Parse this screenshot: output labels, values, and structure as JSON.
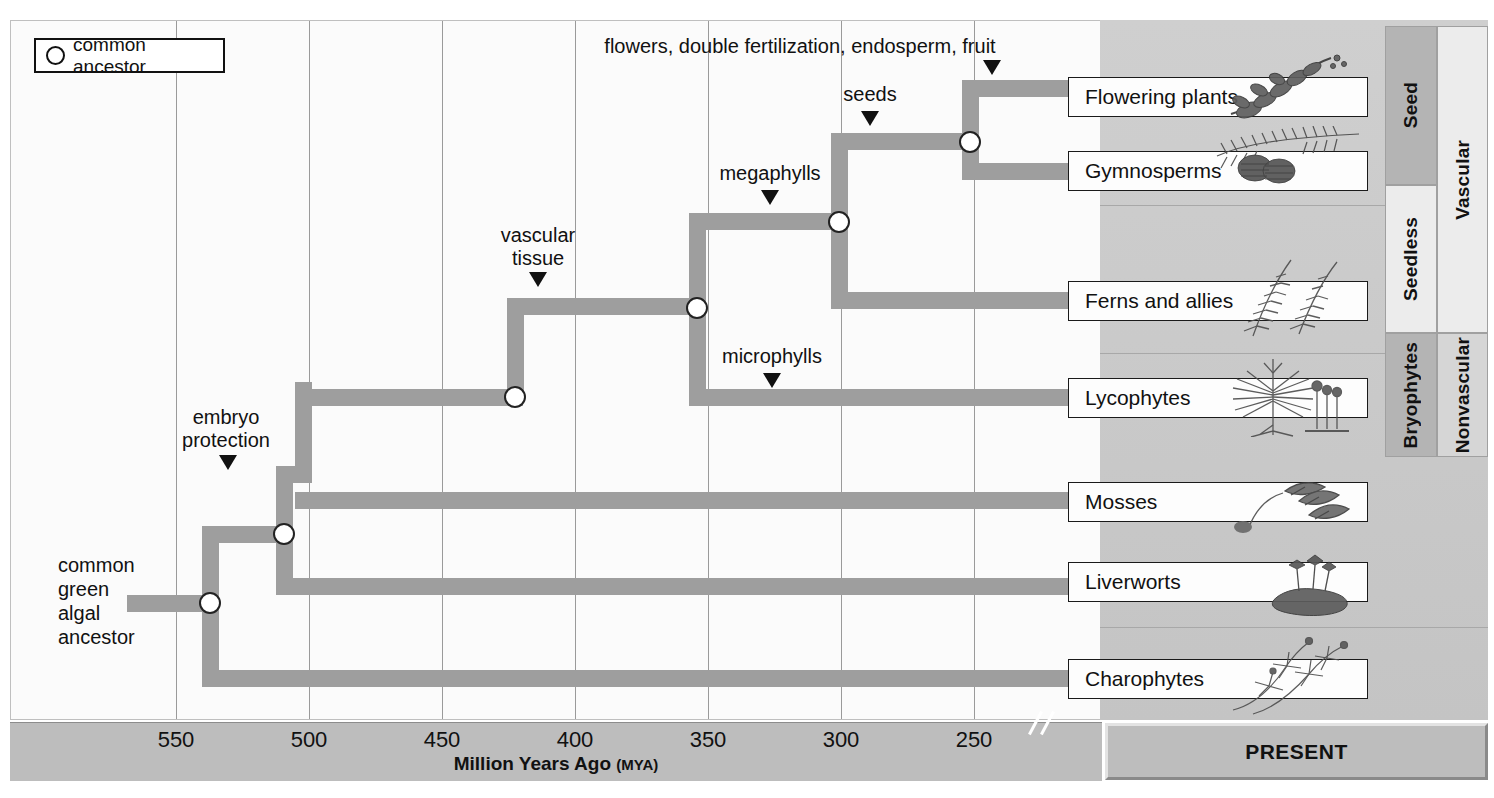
{
  "legend": {
    "label": "common ancestor",
    "icon": "circle-node-icon"
  },
  "axis": {
    "title_main": "Million Years Ago",
    "title_unit": "(MYA)",
    "ticks": [
      {
        "label": "550",
        "x": 176
      },
      {
        "label": "500",
        "x": 309
      },
      {
        "label": "450",
        "x": 442
      },
      {
        "label": "400",
        "x": 575
      },
      {
        "label": "350",
        "x": 708
      },
      {
        "label": "300",
        "x": 841
      },
      {
        "label": "250",
        "x": 974
      }
    ],
    "break_marker": "axis-break",
    "present_label": "PRESENT"
  },
  "root_label": {
    "lines": [
      "common",
      "green",
      "algal",
      "ancestor"
    ]
  },
  "annotations": [
    {
      "name": "embryo-protection",
      "text": "embryo\nprotection",
      "x": 226,
      "y": 408,
      "arrow_x": 228,
      "arrow_y": 455
    },
    {
      "name": "vascular-tissue",
      "text": "vascular\ntissue",
      "x": 538,
      "y": 226,
      "arrow_x": 538,
      "arrow_y": 273
    },
    {
      "name": "megaphylls",
      "text": "megaphylls",
      "x": 770,
      "y": 165,
      "arrow_x": 770,
      "arrow_y": 190
    },
    {
      "name": "microphylls",
      "text": "microphylls",
      "x": 772,
      "y": 348,
      "arrow_x": 772,
      "arrow_y": 373
    },
    {
      "name": "seeds",
      "text": "seeds",
      "x": 870,
      "y": 85,
      "arrow_x": 870,
      "arrow_y": 110
    },
    {
      "name": "flowers-double-fertilization",
      "text": "flowers, double fertilization, endosperm, fruit",
      "x": 800,
      "y": 36,
      "arrow_x": 992,
      "arrow_y": 60
    }
  ],
  "taxa": [
    {
      "name": "flowering-plants",
      "label": "Flowering plants",
      "y": 77,
      "art": "flowering-plant-illustration"
    },
    {
      "name": "gymnosperms",
      "label": "Gymnosperms",
      "y": 151,
      "art": "conifer-cone-illustration"
    },
    {
      "name": "ferns-and-allies",
      "label": "Ferns and allies",
      "y": 281,
      "art": "fern-illustration"
    },
    {
      "name": "lycophytes",
      "label": "Lycophytes",
      "y": 378,
      "art": "lycophyte-illustration"
    },
    {
      "name": "mosses",
      "label": "Mosses",
      "y": 482,
      "art": "moss-illustration"
    },
    {
      "name": "liverworts",
      "label": "Liverworts",
      "y": 562,
      "art": "liverwort-illustration"
    },
    {
      "name": "charophytes",
      "label": "Charophytes",
      "y": 659,
      "art": "charophyte-illustration"
    }
  ],
  "category_columns": [
    {
      "name": "seed",
      "label": "Seed",
      "left": 1385,
      "top": 26,
      "height": 159,
      "shade": "#b4b4b4"
    },
    {
      "name": "seedless",
      "label": "Seedless",
      "left": 1385,
      "top": 185,
      "height": 148,
      "shade": "#ececec"
    },
    {
      "name": "bryophytes",
      "label": "Bryophytes",
      "left": 1385,
      "top": 333,
      "height": 124,
      "shade": "#b4b4b4"
    },
    {
      "name": "vascular",
      "label": "Vascular",
      "left": 1437,
      "top": 26,
      "height": 307,
      "shade": "#ececec"
    },
    {
      "name": "nonvascular",
      "label": "Nonvascular",
      "left": 1437,
      "top": 333,
      "height": 124,
      "shade": "#d6d6d6"
    }
  ],
  "colors": {
    "branch": "#9e9e9e",
    "grid": "#9a9a9a",
    "axis_bar": "#bdbdbd",
    "present_panel": "#c9c9c9",
    "text": "#111111"
  },
  "tree": {
    "nodes": [
      {
        "name": "node-root",
        "x": 210,
        "y": 603
      },
      {
        "name": "node-embryophyte",
        "x": 284,
        "y": 534
      },
      {
        "name": "node-vascular",
        "x": 515,
        "y": 397
      },
      {
        "name": "node-euphyll",
        "x": 697,
        "y": 308
      },
      {
        "name": "node-megaphyll",
        "x": 839,
        "y": 222
      },
      {
        "name": "node-seed",
        "x": 970,
        "y": 142
      }
    ]
  }
}
